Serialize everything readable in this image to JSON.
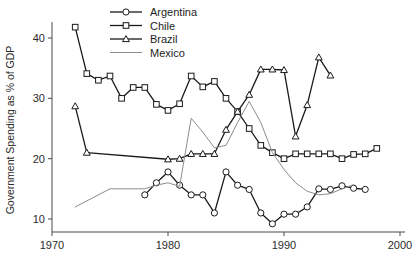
{
  "chart_data": {
    "type": "line",
    "title": "",
    "xlabel": "",
    "ylabel": "Government Spending as % of GDP",
    "xlim": [
      1970,
      2000
    ],
    "ylim": [
      7.5,
      43
    ],
    "xticks": [
      1970,
      1980,
      1990,
      2000
    ],
    "yticks": [
      10,
      20,
      30,
      40
    ],
    "grid": false,
    "legend_position": "top-center",
    "series": [
      {
        "name": "Argentina",
        "marker": "circle",
        "color": "#1a1a1a",
        "x": [
          1978,
          1979,
          1980,
          1981,
          1982,
          1983,
          1984,
          1985,
          1986,
          1987,
          1988,
          1989,
          1990,
          1991,
          1992,
          1993,
          1994,
          1995,
          1996,
          1997
        ],
        "values": [
          14.0,
          16.0,
          17.8,
          15.6,
          14.0,
          14.0,
          11.0,
          17.8,
          15.6,
          14.9,
          11.0,
          9.2,
          10.8,
          10.8,
          12.0,
          15.0,
          14.9,
          15.5,
          15.1,
          14.9
        ]
      },
      {
        "name": "Chile",
        "marker": "square",
        "color": "#1a1a1a",
        "x": [
          1972,
          1973,
          1974,
          1975,
          1976,
          1977,
          1978,
          1979,
          1980,
          1981,
          1982,
          1983,
          1984,
          1985,
          1986,
          1987,
          1988,
          1989,
          1990,
          1991,
          1992,
          1993,
          1994,
          1995,
          1996,
          1997,
          1998
        ],
        "values": [
          41.8,
          34.1,
          33.0,
          33.7,
          30.0,
          31.8,
          31.8,
          29.0,
          28.0,
          29.1,
          33.7,
          31.9,
          32.8,
          30.0,
          27.8,
          25.0,
          22.2,
          21.0,
          20.0,
          20.8,
          20.8,
          20.8,
          20.8,
          20.0,
          20.7,
          20.8,
          21.7
        ]
      },
      {
        "name": "Brazil",
        "marker": "triangle",
        "color": "#1a1a1a",
        "x": [
          1972,
          1973,
          1980,
          1981,
          1982,
          1983,
          1984,
          1985,
          1986,
          1987,
          1988,
          1989,
          1990,
          1991,
          1992,
          1993,
          1994
        ],
        "values": [
          28.7,
          21.0,
          19.9,
          20.0,
          20.8,
          20.8,
          20.8,
          24.8,
          27.8,
          30.6,
          34.8,
          34.8,
          34.7,
          23.7,
          28.9,
          36.8,
          33.8
        ]
      },
      {
        "name": "Mexico",
        "marker": "none",
        "color": "#8c8c8c",
        "x": [
          1972,
          1975,
          1978,
          1979,
          1980,
          1981,
          1982,
          1983,
          1984,
          1985,
          1986,
          1987,
          1988,
          1989,
          1990,
          1991,
          1992,
          1993,
          1994,
          1995,
          1996
        ],
        "values": [
          12.0,
          15.0,
          15.0,
          15.6,
          16.0,
          15.4,
          26.7,
          24.4,
          21.8,
          22.2,
          26.0,
          29.5,
          26.0,
          21.0,
          18.2,
          16.0,
          14.6,
          14.0,
          14.2,
          15.0,
          15.7
        ]
      }
    ]
  },
  "legend": {
    "entries": [
      "Argentina",
      "Chile",
      "Brazil",
      "Mexico"
    ]
  }
}
